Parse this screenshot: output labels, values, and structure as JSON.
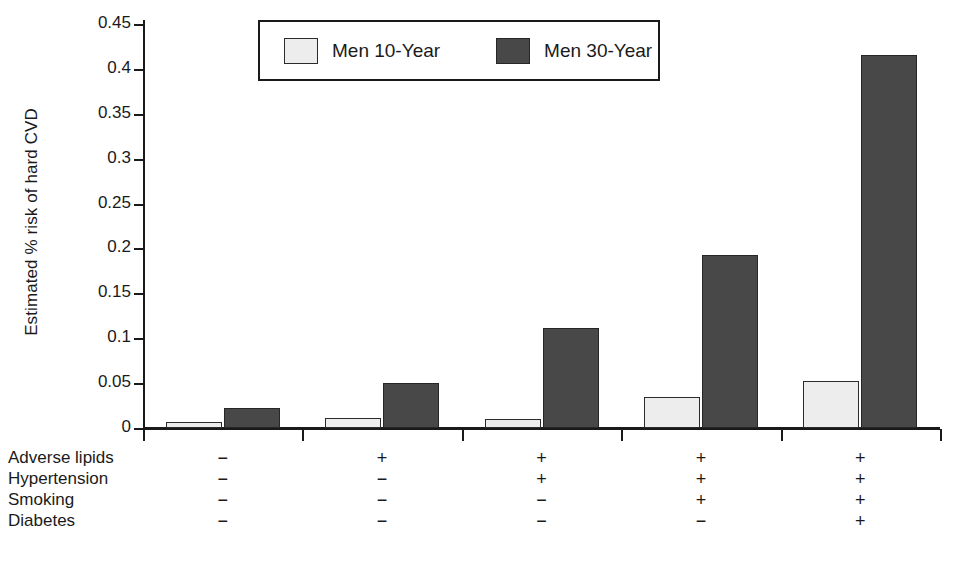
{
  "axis": {
    "ylabel": "Estimated % risk of hard CVD",
    "yticks": [
      "0",
      "0.05",
      "0.1",
      "0.15",
      "0.2",
      "0.25",
      "0.3",
      "0.35",
      "0.4",
      "0.45"
    ]
  },
  "legend": {
    "items": [
      {
        "label": "Men 10-Year",
        "color": "#ededed"
      },
      {
        "label": "Men 30-Year",
        "color": "#484848"
      }
    ]
  },
  "matrix": {
    "rows": [
      {
        "label": "Adverse lipids",
        "values": [
          "−",
          "+",
          "+",
          "+",
          "+"
        ]
      },
      {
        "label": "Hypertension",
        "values": [
          "−",
          "−",
          "+",
          "+",
          "+"
        ]
      },
      {
        "label": "Smoking",
        "values": [
          "−",
          "−",
          "−",
          "+",
          "+"
        ]
      },
      {
        "label": "Diabetes",
        "values": [
          "−",
          "−",
          "−",
          "−",
          "+"
        ]
      }
    ]
  },
  "chart_data": {
    "type": "bar",
    "title": "",
    "xlabel": "",
    "ylabel": "Estimated % risk of hard CVD",
    "ylim": [
      0,
      0.45
    ],
    "ytick_step": 0.05,
    "grid": false,
    "legend_position": "top-center",
    "categories": [
      "1",
      "2",
      "3",
      "4",
      "5"
    ],
    "series": [
      {
        "name": "Men 10-Year",
        "color": "#ededed",
        "values": [
          0.007,
          0.011,
          0.01,
          0.034,
          0.052
        ]
      },
      {
        "name": "Men 30-Year",
        "color": "#484848",
        "values": [
          0.022,
          0.05,
          0.111,
          0.193,
          0.415
        ]
      }
    ],
    "risk_factors": {
      "rows": [
        "Adverse lipids",
        "Hypertension",
        "Smoking",
        "Diabetes"
      ],
      "matrix": [
        [
          "−",
          "+",
          "+",
          "+",
          "+"
        ],
        [
          "−",
          "−",
          "+",
          "+",
          "+"
        ],
        [
          "−",
          "−",
          "−",
          "+",
          "+"
        ],
        [
          "−",
          "−",
          "−",
          "−",
          "+"
        ]
      ]
    }
  }
}
